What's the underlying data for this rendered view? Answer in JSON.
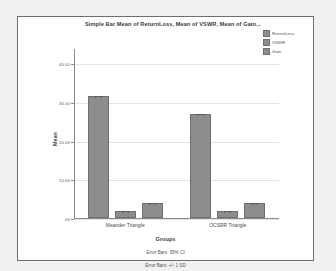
{
  "chart_data": {
    "type": "bar",
    "title": "Simple Bar Mean of ReturnLoss, Mean of VSWR, Mean of Gain...",
    "xlabel": "Groups",
    "ylabel": "Mean",
    "categories": [
      "Meander Triangle",
      "OCSRR Triangle"
    ],
    "series": [
      {
        "name": "ReturnLoss",
        "values": [
          31.5,
          27.0
        ],
        "color": "#8d8d8d"
      },
      {
        "name": "VSWR",
        "values": [
          1.9,
          1.7
        ],
        "color": "#8d8d8d"
      },
      {
        "name": "Gain",
        "values": [
          4.0,
          3.8
        ],
        "color": "#8d8d8d"
      }
    ],
    "ylim": [
      0,
      44
    ],
    "yticks": [
      0,
      10,
      20,
      30,
      40
    ],
    "ytick_labels": [
      ".00",
      "10.00",
      "20.00",
      "30.00",
      "40.00"
    ],
    "grid": true,
    "legend_position": "top-right",
    "error_bars": true,
    "annotations": [
      "Error Bars: 95% CI",
      "Error Bars: +/- 1 SD"
    ]
  },
  "legend": {
    "items": [
      {
        "label": "ReturnLoss"
      },
      {
        "label": "VSWR"
      },
      {
        "label": "Gain"
      }
    ]
  },
  "footnotes": {
    "line1": "Error Bars: 95% CI",
    "line2": "Error Bars: +/- 1 SD"
  },
  "colors": {
    "bar": "#8d8d8d",
    "bar_border": "#6f6f6f",
    "frame": "#6e6e6e",
    "grid": "#e3e3e3",
    "axis": "#8a8a8a",
    "page_background": "#f2f1f0",
    "plot_background": "#ffffff"
  }
}
